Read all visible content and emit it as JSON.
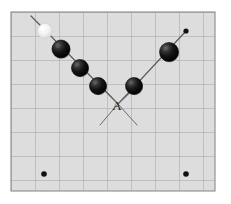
{
  "figure": {
    "colors": {
      "paper_background": "#e8e8e8",
      "paper_fill": "#e4e4e4",
      "grid_line": "#9a9aa0",
      "grid_border": "#8a8a90",
      "page_background": "#ffffff",
      "ball_dark": "#151515",
      "ball_dark_edge": "#000000",
      "ball_highlight": "#5a5a5a",
      "ball_white": "#f2f2f2",
      "ball_white_edge": "#c8c8c8",
      "trajectory_line": "#5c5c5c",
      "angle_line": "#6a6a6a",
      "marker_dot": "#111111",
      "label_text": "#1a1a1a"
    },
    "grid": {
      "left": 11,
      "top": 12,
      "right": 215,
      "bottom": 191,
      "cell_size": 24,
      "columns": 8,
      "rows": 7
    },
    "labels": [
      {
        "id": "angle-label-a",
        "text": "A",
        "x": 117,
        "y": 110,
        "font_size": 13
      }
    ],
    "trajectory": {
      "incoming_line": {
        "x1": 31,
        "y1": 16,
        "x2": 118,
        "y2": 104
      },
      "outgoing_line": {
        "x1": 118,
        "y1": 104,
        "x2": 186,
        "y2": 31
      },
      "vertex": {
        "x": 118,
        "y": 104
      }
    },
    "angle_marks": [
      {
        "id": "angle-arm-left",
        "x1": 118,
        "y1": 104,
        "x2": 100,
        "y2": 125
      },
      {
        "id": "angle-arm-right",
        "x1": 118,
        "y1": 104,
        "x2": 137,
        "y2": 125
      },
      {
        "id": "angle-cross-left",
        "x1": 118,
        "y1": 104,
        "x2": 106,
        "y2": 91
      },
      {
        "id": "angle-cross-right",
        "x1": 118,
        "y1": 104,
        "x2": 131,
        "y2": 92
      }
    ],
    "balls": [
      {
        "id": "ball-1-white",
        "cx": 45,
        "cy": 31,
        "r": 7.5,
        "kind": "white"
      },
      {
        "id": "ball-2",
        "cx": 61,
        "cy": 49,
        "r": 9.0,
        "kind": "dark"
      },
      {
        "id": "ball-3",
        "cx": 80,
        "cy": 68,
        "r": 8.5,
        "kind": "dark"
      },
      {
        "id": "ball-4",
        "cx": 98,
        "cy": 86,
        "r": 8.5,
        "kind": "dark"
      },
      {
        "id": "ball-5",
        "cx": 134,
        "cy": 86,
        "r": 8.5,
        "kind": "dark"
      },
      {
        "id": "ball-6",
        "cx": 169,
        "cy": 52,
        "r": 9.5,
        "kind": "dark"
      }
    ],
    "marker_dots": [
      {
        "id": "dot-line-end",
        "cx": 186,
        "cy": 31,
        "r": 2.6
      },
      {
        "id": "dot-bottom-left",
        "cx": 44,
        "cy": 174,
        "r": 2.8
      },
      {
        "id": "dot-bottom-right",
        "cx": 186,
        "cy": 174,
        "r": 2.8
      }
    ]
  }
}
